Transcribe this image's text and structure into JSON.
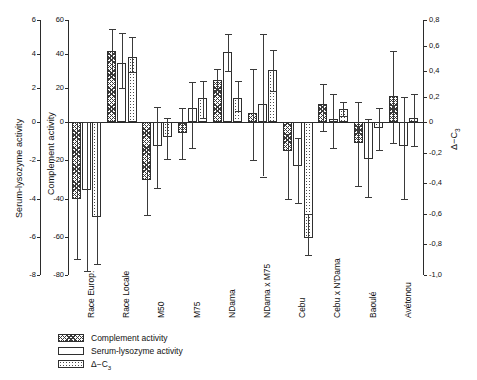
{
  "chart_data": {
    "type": "bar",
    "title": "",
    "categories": [
      "Race Europ.",
      "Race Locale",
      "M50",
      "M75",
      "NDama",
      "NDama x M75",
      "Cebu",
      "Cebu x N'Dama",
      "Baoulé",
      "Avétonou"
    ],
    "series": [
      {
        "name": "Complement activity",
        "axis": "left-inner",
        "pattern": "hatch",
        "values": [
          -40,
          41.5,
          -30.5,
          -5.5,
          25,
          5.5,
          -15,
          10.5,
          -11,
          15.5
        ],
        "err_low": [
          -71.5,
          28.5,
          -48.5,
          -19.5,
          19,
          -20,
          -40.5,
          -4.5,
          -33.5,
          -11
        ],
        "err_high": [
          0,
          54.5,
          -13,
          8,
          31,
          31,
          -6.5,
          22.5,
          12,
          42
        ]
      },
      {
        "name": "Serum-lysozyme activity",
        "axis": "left-outer",
        "pattern": "open",
        "values": [
          -3.55,
          3.5,
          -1.25,
          0.85,
          4.1,
          1.05,
          -2.3,
          0.2,
          -1.95,
          -1.25
        ],
        "err_low": [
          -7.8,
          2.0,
          -3.45,
          -1.35,
          3.0,
          -2.85,
          -4.25,
          -1.35,
          -3.9,
          -4.0
        ],
        "err_high": [
          0,
          5.25,
          0.9,
          2.35,
          5.2,
          5.15,
          -0.85,
          1.65,
          0.2,
          1.5
        ]
      },
      {
        "name": "Δ-C3",
        "axis": "right",
        "pattern": "dots",
        "values": [
          -0.62,
          0.51,
          -0.1,
          0.185,
          0.185,
          0.405,
          -0.76,
          0.1,
          -0.04,
          0.03
        ],
        "err_low": [
          -0.93,
          0.395,
          -0.24,
          0.035,
          0.09,
          0.24,
          -0.87,
          0.045,
          -0.185,
          -0.16
        ],
        "err_high": [
          0,
          0.67,
          0.035,
          0.325,
          0.32,
          0.565,
          -0.6,
          0.155,
          0.11,
          0.22
        ]
      }
    ],
    "axes": {
      "left_outer": {
        "label": "Serum-lysozyme activity",
        "ticks": [
          "6",
          "4",
          "2",
          "0",
          "-2",
          "-4",
          "-6",
          "-8"
        ],
        "values": [
          6,
          4,
          2,
          0,
          -2,
          -4,
          -6,
          -8
        ],
        "min": -8,
        "max": 6
      },
      "left_inner": {
        "label": "Complement activity",
        "ticks": [
          "60",
          "40",
          "20",
          "0",
          "-20",
          "-40",
          "-60",
          "-80"
        ],
        "values": [
          60,
          40,
          20,
          0,
          -20,
          -40,
          -60,
          -80
        ],
        "min": -80,
        "max": 60
      },
      "right": {
        "label": "Δ-C3",
        "ticks": [
          "0,8",
          "0,6",
          "0,4",
          "0,2",
          "0",
          "-0,2",
          "-0,4",
          "-0,6",
          "-0,8",
          "-1,0"
        ],
        "values": [
          0.8,
          0.6,
          0.4,
          0.2,
          0,
          -0.2,
          -0.4,
          -0.6,
          -0.8,
          -1.0
        ],
        "min": -1.0,
        "max": 0.8
      }
    },
    "grid": false,
    "legend_position": "bottom-left"
  },
  "legend": {
    "items": [
      {
        "label": "Complement activity",
        "pattern": "hatch"
      },
      {
        "label": "Serum-lysozyme activity",
        "pattern": "open"
      },
      {
        "label": "Δ-C3",
        "pattern": "dots"
      }
    ]
  },
  "colors": {
    "axis": "#2b2b2b",
    "bar_edge": "#2f2f2f",
    "background": "#ffffff"
  }
}
